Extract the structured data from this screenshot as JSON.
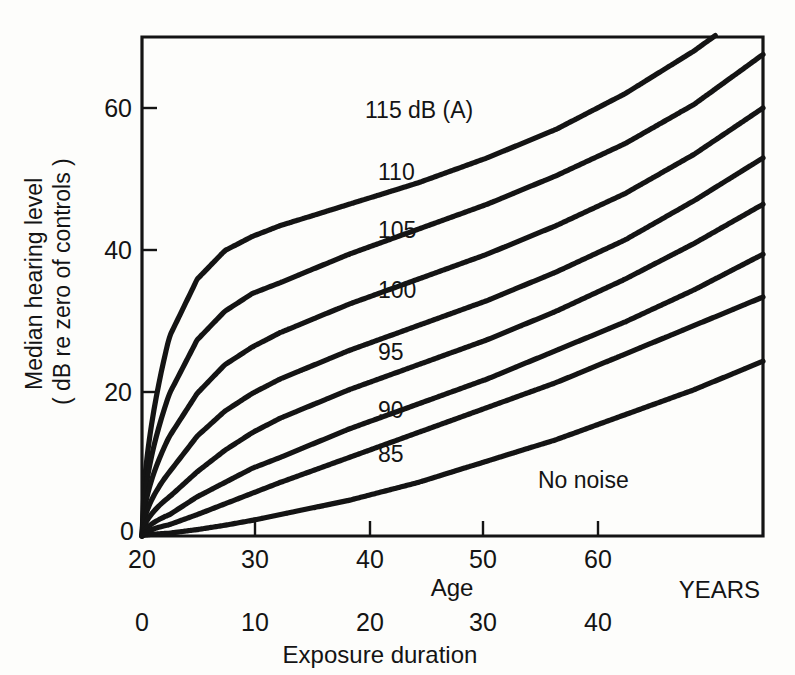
{
  "figure": {
    "background": "#fdfdfb",
    "ink": "#141414"
  },
  "axes": {
    "y_axis_title_line1": "Median hearing level",
    "y_axis_title_line2": "( dB re zero of controls )",
    "y_ticks": [
      "0",
      "20",
      "40",
      "60"
    ],
    "x_primary_title": "Age",
    "x_primary_unit": "YEARS",
    "x_primary_ticks": [
      "20",
      "30",
      "40",
      "50",
      "60"
    ],
    "x_secondary_title": "Exposure duration",
    "x_secondary_ticks": [
      "0",
      "10",
      "20",
      "30",
      "40"
    ]
  },
  "curve_labels": {
    "l115": "115 dB (A)",
    "l110": "110",
    "l105": "105",
    "l100": "100",
    "l95": "95",
    "l90": "90",
    "l85": "85",
    "lnone": "No noise"
  },
  "chart_data": {
    "type": "line",
    "title": "",
    "xlabel": "Age",
    "ylabel": "Median hearing level ( dB re zero of controls )",
    "xlim": [
      20,
      65
    ],
    "ylim": [
      0,
      67
    ],
    "grid": false,
    "legend": "inline-curve-labels",
    "x_secondary_label": "Exposure duration",
    "x_secondary_lim": [
      0,
      45
    ],
    "x_unit": "YEARS",
    "x": [
      20,
      22,
      24,
      26,
      28,
      30,
      35,
      40,
      45,
      50,
      55,
      60,
      65
    ],
    "series": [
      {
        "name": "115 dB (A)",
        "values": [
          0,
          28,
          36,
          40,
          42,
          43.5,
          46.5,
          49.5,
          53,
          57,
          62,
          68,
          75
        ]
      },
      {
        "name": "110",
        "values": [
          0,
          20,
          27.5,
          31.5,
          34,
          35.5,
          39.5,
          43,
          46.5,
          50.5,
          55,
          60.5,
          67.5
        ]
      },
      {
        "name": "105",
        "values": [
          0,
          14,
          20,
          24,
          26.5,
          28.5,
          32.5,
          36,
          39.5,
          43.5,
          48,
          53.5,
          60
        ]
      },
      {
        "name": "100",
        "values": [
          0,
          9,
          14,
          17.5,
          20,
          22,
          26,
          29.5,
          33,
          37,
          41.5,
          47,
          53
        ]
      },
      {
        "name": "95",
        "values": [
          0,
          5.5,
          9,
          12,
          14.5,
          16.5,
          20.5,
          24,
          27.5,
          31.5,
          36,
          41,
          46.5
        ]
      },
      {
        "name": "90",
        "values": [
          0,
          3,
          5.5,
          7.5,
          9.5,
          11,
          15,
          18.5,
          22,
          26,
          30,
          34.5,
          39.5
        ]
      },
      {
        "name": "85",
        "values": [
          0,
          1.6,
          3,
          4.5,
          6,
          7.5,
          11,
          14.5,
          18,
          21.5,
          25.5,
          29.5,
          33.5
        ]
      },
      {
        "name": "No noise",
        "values": [
          0,
          0.4,
          0.9,
          1.5,
          2.2,
          3,
          5,
          7.5,
          10.5,
          13.5,
          17,
          20.5,
          24.5
        ]
      }
    ]
  }
}
